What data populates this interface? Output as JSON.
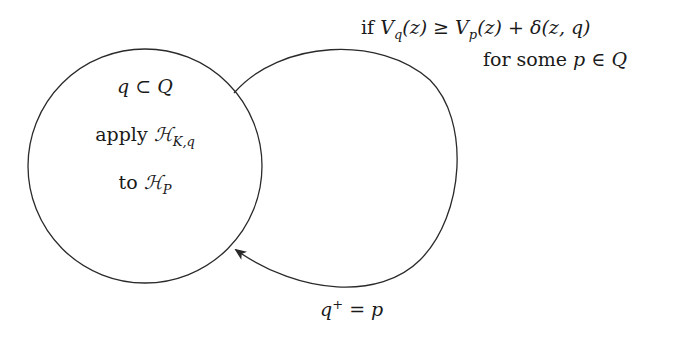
{
  "diagram": {
    "state": {
      "line1": {
        "var": "q",
        "rel": "⊂",
        "set": "Q"
      },
      "line2": {
        "word": "apply",
        "op": "ℋ",
        "sub": "K,q"
      },
      "line3": {
        "word": "to",
        "op": "ℋ",
        "sub": "P"
      }
    },
    "guard": {
      "line1": {
        "if": "if",
        "lhs": "V",
        "lhs_sub": "q",
        "lhs_arg": "(z)",
        "rel": "≥",
        "rhs": "V",
        "rhs_sub": "p",
        "rhs_arg": "(z)",
        "plus": "+",
        "delta": "δ",
        "delta_arg": "(z, q)"
      },
      "line2": {
        "text": "for some",
        "var": "p",
        "rel": "∈",
        "set": "Q"
      }
    },
    "reset": {
      "var": "q",
      "sup": "+",
      "eq": "=",
      "val": "p"
    },
    "colors": {
      "stroke": "#2a2a2a",
      "text": "#1a1a1a",
      "background": "#ffffff"
    }
  }
}
